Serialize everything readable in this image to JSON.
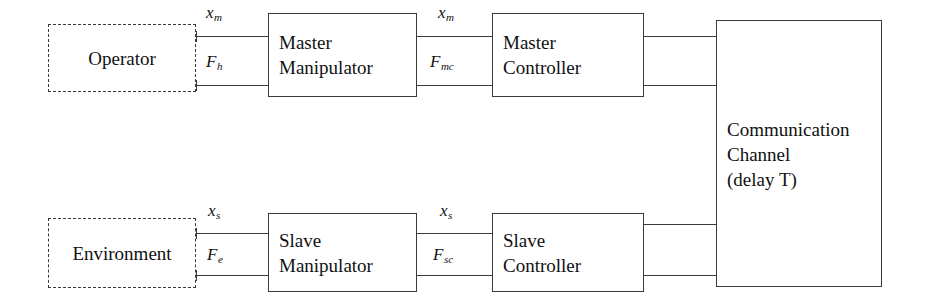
{
  "diagram": {
    "background_color": "#ffffff",
    "line_color": "#3a3a3a",
    "text_color": "#111111",
    "blocks": {
      "operator": {
        "label": "Operator",
        "style": "dashed"
      },
      "master_manipulator": {
        "label": "Master\nManipulator",
        "style": "solid"
      },
      "master_controller": {
        "label": "Master\nController",
        "style": "solid"
      },
      "communication_channel": {
        "label": "Communication\nChannel\n(delay T)",
        "style": "solid"
      },
      "environment": {
        "label": "Environment",
        "style": "dashed"
      },
      "slave_manipulator": {
        "label": "Slave\nManipulator",
        "style": "solid"
      },
      "slave_controller": {
        "label": "Slave\nController",
        "style": "solid"
      }
    },
    "signals": {
      "operator_to_master_position": {
        "base": "x",
        "sub": "m"
      },
      "operator_to_master_force": {
        "base": "F",
        "sub": "h"
      },
      "master_to_controller_position": {
        "base": "x",
        "sub": "m"
      },
      "master_to_controller_force": {
        "base": "F",
        "sub": "mc"
      },
      "environment_to_slave_position": {
        "base": "x",
        "sub": "s"
      },
      "environment_to_slave_force": {
        "base": "F",
        "sub": "e"
      },
      "slave_to_controller_position": {
        "base": "x",
        "sub": "s"
      },
      "slave_to_controller_force": {
        "base": "F",
        "sub": "sc"
      }
    }
  }
}
